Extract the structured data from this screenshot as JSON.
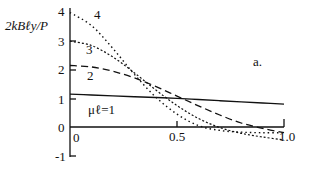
{
  "chart_data": {
    "type": "line",
    "title": "",
    "panel_label": "a.",
    "xlabel": "",
    "ylabel": "2kBℓy/P",
    "xlim": [
      0,
      1.0
    ],
    "ylim": [
      -1,
      4
    ],
    "x_ticks": [
      "0",
      "0.5",
      "1.0"
    ],
    "y_ticks": [
      "-1",
      "0",
      "1",
      "2",
      "3",
      "4"
    ],
    "grid": false,
    "x": [
      0,
      0.1,
      0.2,
      0.3,
      0.4,
      0.5,
      0.6,
      0.7,
      0.8,
      0.9,
      1.0
    ],
    "series": [
      {
        "name": "μℓ=1",
        "label": "μℓ=1",
        "style": "solid",
        "values": [
          1.15,
          1.12,
          1.09,
          1.06,
          1.03,
          1.0,
          0.96,
          0.92,
          0.88,
          0.84,
          0.8
        ]
      },
      {
        "name": "μℓ=2",
        "label": "2",
        "style": "dashed",
        "values": [
          2.15,
          2.1,
          1.95,
          1.72,
          1.42,
          1.08,
          0.74,
          0.42,
          0.14,
          -0.05,
          -0.2
        ]
      },
      {
        "name": "μℓ=3",
        "label": "3",
        "style": "fine-dotted",
        "values": [
          3.0,
          2.85,
          2.45,
          1.9,
          1.3,
          0.75,
          0.3,
          -0.02,
          -0.22,
          -0.35,
          -0.45
        ]
      },
      {
        "name": "μℓ=4",
        "label": "4",
        "style": "dotted",
        "values": [
          4.0,
          3.55,
          2.75,
          1.85,
          1.05,
          0.45,
          0.05,
          -0.12,
          -0.18,
          -0.2,
          -0.2
        ]
      }
    ]
  },
  "labels": {
    "ylabel": "2kBℓy/P",
    "panel": "a.",
    "curve1": "μℓ=1",
    "curve2": "2",
    "curve3": "3",
    "curve4": "4",
    "tick_x0": "0",
    "tick_x05": "0.5",
    "tick_x1": "1.0",
    "tick_ym1": "-1",
    "tick_y0": "0",
    "tick_y1": "1",
    "tick_y2": "2",
    "tick_y3": "3",
    "tick_y4": "4"
  }
}
